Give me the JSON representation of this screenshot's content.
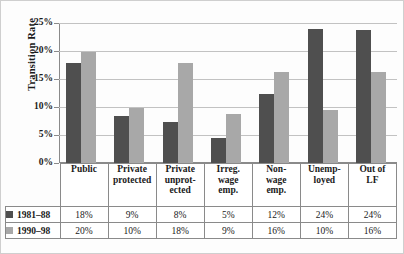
{
  "chart_data": {
    "type": "bar",
    "title": "",
    "xlabel": "",
    "ylabel": "Transition Rate",
    "ylim": [
      0,
      25
    ],
    "grid": true,
    "legend_position": "bottom-table",
    "categories": [
      "Public",
      "Private protected",
      "Private unprot- ected",
      "Irreg. wage emp.",
      "Non- wage emp.",
      "Unemp- loyed",
      "Out of LF"
    ],
    "category_lines": [
      [
        "Public"
      ],
      [
        "Private",
        "protected"
      ],
      [
        "Private",
        "unprot-",
        "ected"
      ],
      [
        "Irreg.",
        "wage",
        "emp."
      ],
      [
        "Non-",
        "wage",
        "emp."
      ],
      [
        "Unemp-",
        "loyed"
      ],
      [
        "Out of",
        "LF"
      ]
    ],
    "series": [
      {
        "name": "1981–88",
        "color": "#4f4f4f",
        "values": [
          17.9,
          8.4,
          7.4,
          4.5,
          12.3,
          23.9,
          23.8
        ],
        "labels": [
          "18%",
          "9%",
          "8%",
          "5%",
          "12%",
          "24%",
          "24%"
        ]
      },
      {
        "name": "1990–98",
        "color": "#a8a8a8",
        "values": [
          19.9,
          9.8,
          17.8,
          8.7,
          16.2,
          9.5,
          16.3
        ],
        "labels": [
          "20%",
          "10%",
          "18%",
          "9%",
          "16%",
          "10%",
          "16%"
        ]
      }
    ],
    "yticks": [
      {
        "value": 25,
        "label": "25%"
      },
      {
        "value": 20,
        "label": "20%"
      },
      {
        "value": 15,
        "label": "15%"
      },
      {
        "value": 10,
        "label": "10%"
      },
      {
        "value": 5,
        "label": "5%"
      },
      {
        "value": 0,
        "label": "0%"
      }
    ]
  }
}
